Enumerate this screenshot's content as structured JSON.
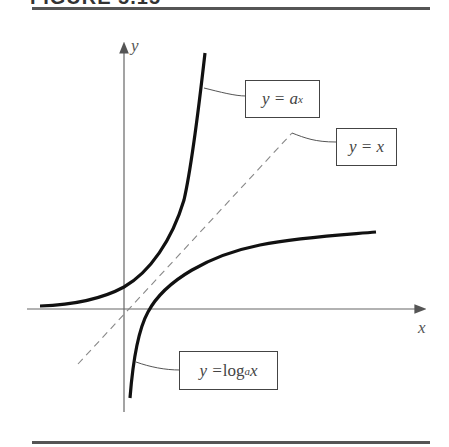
{
  "figure": {
    "title": "FIGURE 5.15"
  },
  "axes": {
    "x_label": "x",
    "y_label": "y"
  },
  "labels": {
    "exp": {
      "lhs": "y = a",
      "sup": "x"
    },
    "identity": {
      "text": "y = x"
    },
    "log": {
      "lhs": "y = ",
      "fn": "log",
      "sub": "a",
      "arg": " x"
    }
  },
  "colors": {
    "curve": "#111111",
    "axis": "#666666",
    "dashed": "#888888"
  }
}
